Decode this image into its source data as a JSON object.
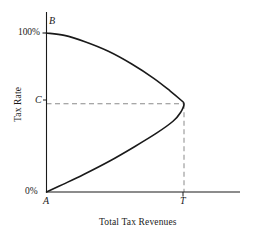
{
  "chart_data": {
    "type": "line",
    "xlabel": "Total Tax Revenues",
    "ylabel": "Tax Rate",
    "grid": false,
    "legend": null,
    "xlim": [
      0,
      1.08
    ],
    "ylim": [
      0,
      1.12
    ],
    "axis_ticks": {
      "y": [
        {
          "label": "0%",
          "value": 0
        },
        {
          "label": "100%",
          "value": 1
        }
      ],
      "x": [
        {
          "label": "T",
          "value": 1
        }
      ]
    },
    "annotations": [
      {
        "label": "B",
        "x": 0,
        "y": 1,
        "note": "100% tax rate, zero revenue"
      },
      {
        "label": "C",
        "x": 0,
        "y": 0.555,
        "note": "revenue-maximizing tax rate"
      },
      {
        "label": "A",
        "x": 0,
        "y": 0,
        "note": "0% tax rate, zero revenue"
      },
      {
        "label": "T",
        "x": 1,
        "y": 0,
        "note": "maximum total tax revenue"
      }
    ],
    "series": [
      {
        "name": "Laffer curve",
        "style": "solid",
        "color": "#1a1a1a",
        "points": [
          {
            "x": 0.0,
            "y": 1.0
          },
          {
            "x": 0.13,
            "y": 0.985
          },
          {
            "x": 0.28,
            "y": 0.945
          },
          {
            "x": 0.45,
            "y": 0.885
          },
          {
            "x": 0.62,
            "y": 0.805
          },
          {
            "x": 0.78,
            "y": 0.715
          },
          {
            "x": 0.9,
            "y": 0.635
          },
          {
            "x": 0.975,
            "y": 0.58
          },
          {
            "x": 1.0,
            "y": 0.555
          },
          {
            "x": 0.975,
            "y": 0.5
          },
          {
            "x": 0.92,
            "y": 0.445
          },
          {
            "x": 0.8,
            "y": 0.37
          },
          {
            "x": 0.64,
            "y": 0.285
          },
          {
            "x": 0.46,
            "y": 0.195
          },
          {
            "x": 0.27,
            "y": 0.11
          },
          {
            "x": 0.12,
            "y": 0.048
          },
          {
            "x": 0.0,
            "y": 0.0
          }
        ]
      }
    ],
    "guide_lines": [
      {
        "name": "c-horizontal-dashed",
        "style": "dashed",
        "color": "#8a8a8a",
        "from": {
          "x": 0,
          "y": 0.555
        },
        "to": {
          "x": 1.0,
          "y": 0.555
        }
      },
      {
        "name": "t-vertical-dashed",
        "style": "dashed",
        "color": "#8a8a8a",
        "from": {
          "x": 1.0,
          "y": 0.555
        },
        "to": {
          "x": 1.0,
          "y": 0
        }
      }
    ]
  },
  "labels": {
    "y_tick_top": "100%",
    "y_tick_bottom": "0%",
    "point_b": "B",
    "point_c": "C",
    "point_a": "A",
    "point_t": "T",
    "y_axis_title": "Tax Rate",
    "x_axis_title": "Total Tax Revenues"
  },
  "colors": {
    "background": "#ffffff",
    "axis": "#1a1a1a",
    "curve": "#1a1a1a",
    "dashed_guide": "#8a8a8a",
    "text": "#1a1a1a"
  }
}
